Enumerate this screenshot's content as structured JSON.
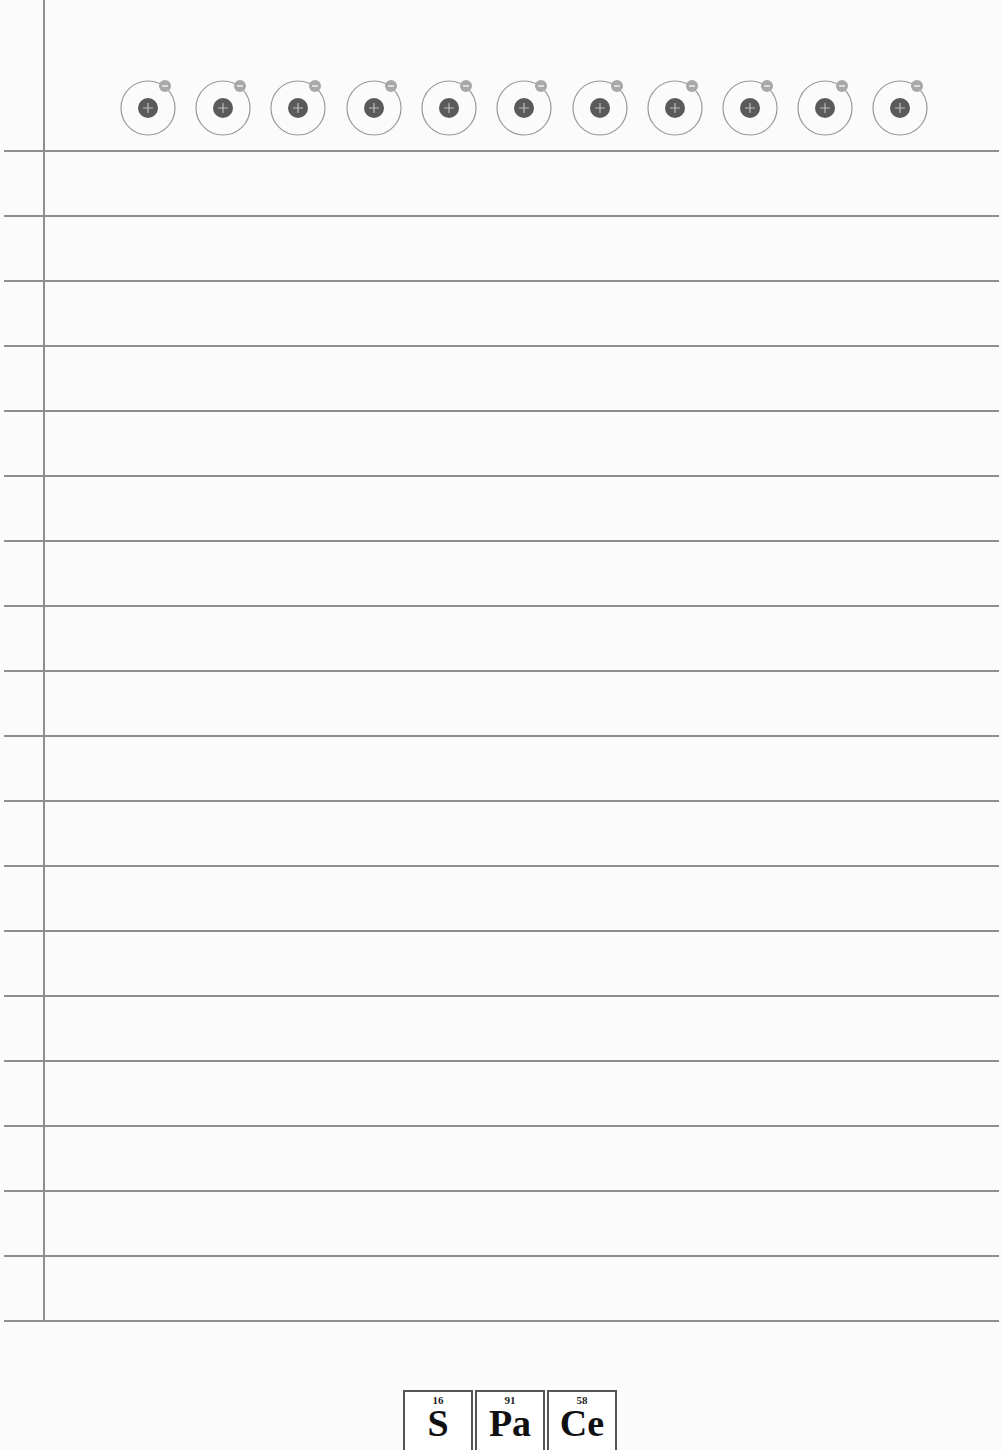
{
  "page": {
    "background": "#fbfbfb",
    "rule_color": "#8e8e8e",
    "ruled_line_count": 19
  },
  "header": {
    "atom_icon_count": 11,
    "atom_icon_positions_x": [
      148,
      223,
      298,
      374,
      449,
      524,
      600,
      675,
      750,
      825,
      900
    ]
  },
  "footer": {
    "logo_tiles": [
      {
        "number": "16",
        "symbol": "S"
      },
      {
        "number": "91",
        "symbol": "Pa"
      },
      {
        "number": "58",
        "symbol": "Ce"
      }
    ]
  }
}
